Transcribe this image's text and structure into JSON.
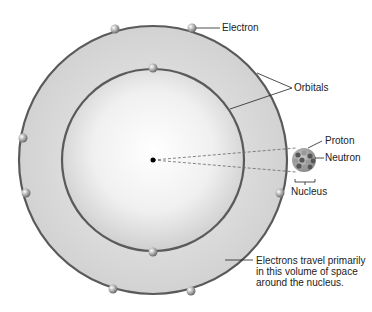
{
  "diagram": {
    "labels": {
      "electron": "Electron",
      "orbitals": "Orbitals",
      "proton": "Proton",
      "neutron": "Neutron",
      "nucleus": "Nucleus",
      "volume_line1": "Electrons travel primarily",
      "volume_line2": "in this volume of space",
      "volume_line3": "around the nucleus."
    },
    "colors": {
      "orbit_stroke": "#5a5a5a",
      "shell_fill": "#d6d6d6",
      "inner_center": "#ffffff"
    }
  }
}
